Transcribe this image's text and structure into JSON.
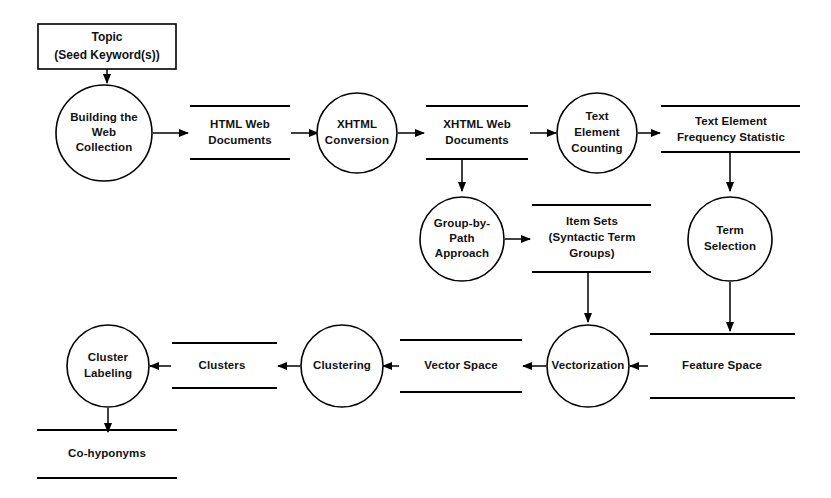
{
  "diagram": {
    "stroke_color": "#000000",
    "background_color": "#ffffff",
    "text_color": "#111111"
  },
  "external_entities": [
    {
      "id": "topic",
      "line1": "Topic",
      "line2": "(Seed Keyword(s))"
    }
  ],
  "processes": [
    {
      "id": "building-the-web-collection",
      "lines": [
        "Building the",
        "Web",
        "Collection"
      ]
    },
    {
      "id": "xhtml-conversion",
      "lines": [
        "XHTML",
        "Conversion"
      ]
    },
    {
      "id": "text-element-counting",
      "lines": [
        "Text",
        "Element",
        "Counting"
      ]
    },
    {
      "id": "group-by-path-approach",
      "lines": [
        "Group-by-",
        "Path",
        "Approach"
      ]
    },
    {
      "id": "term-selection",
      "lines": [
        "Term",
        "Selection"
      ]
    },
    {
      "id": "vectorization",
      "lines": [
        "Vectorization"
      ]
    },
    {
      "id": "clustering",
      "lines": [
        "Clustering"
      ]
    },
    {
      "id": "cluster-labeling",
      "lines": [
        "Cluster",
        "Labeling"
      ]
    }
  ],
  "data_stores": [
    {
      "id": "html-web-documents",
      "lines": [
        "HTML Web",
        "Documents"
      ]
    },
    {
      "id": "xhtml-web-documents",
      "lines": [
        "XHTML Web",
        "Documents"
      ]
    },
    {
      "id": "text-element-frequency-statistic",
      "lines": [
        "Text Element",
        "Frequency Statistic"
      ]
    },
    {
      "id": "item-sets",
      "lines": [
        "Item Sets",
        "(Syntactic Term",
        "Groups)"
      ]
    },
    {
      "id": "feature-space",
      "lines": [
        "Feature Space"
      ]
    },
    {
      "id": "vector-space",
      "lines": [
        "Vector Space"
      ]
    },
    {
      "id": "clusters",
      "lines": [
        "Clusters"
      ]
    },
    {
      "id": "co-hyponyms",
      "lines": [
        "Co-hyponyms"
      ]
    }
  ],
  "flows": [
    {
      "id": "topic-to-building",
      "from": "topic",
      "to": "building-the-web-collection"
    },
    {
      "id": "building-to-html-store",
      "from": "building-the-web-collection",
      "to": "html-web-documents"
    },
    {
      "id": "html-store-to-xhtml-conversion",
      "from": "html-web-documents",
      "to": "xhtml-conversion"
    },
    {
      "id": "xhtml-conversion-to-xhtml-store",
      "from": "xhtml-conversion",
      "to": "xhtml-web-documents"
    },
    {
      "id": "xhtml-store-to-text-element-counting",
      "from": "xhtml-web-documents",
      "to": "text-element-counting"
    },
    {
      "id": "xhtml-store-to-group-by-path",
      "from": "xhtml-web-documents",
      "to": "group-by-path-approach"
    },
    {
      "id": "counting-to-frequency-store",
      "from": "text-element-counting",
      "to": "text-element-frequency-statistic"
    },
    {
      "id": "frequency-store-to-term-selection",
      "from": "text-element-frequency-statistic",
      "to": "term-selection"
    },
    {
      "id": "group-by-path-to-item-sets",
      "from": "group-by-path-approach",
      "to": "item-sets"
    },
    {
      "id": "term-selection-to-feature-space",
      "from": "term-selection",
      "to": "feature-space"
    },
    {
      "id": "item-sets-to-vectorization",
      "from": "item-sets",
      "to": "vectorization"
    },
    {
      "id": "feature-space-to-vectorization",
      "from": "feature-space",
      "to": "vectorization"
    },
    {
      "id": "vectorization-to-vector-space",
      "from": "vectorization",
      "to": "vector-space"
    },
    {
      "id": "vector-space-to-clustering",
      "from": "vector-space",
      "to": "clustering"
    },
    {
      "id": "clustering-to-clusters",
      "from": "clustering",
      "to": "clusters"
    },
    {
      "id": "clusters-to-cluster-labeling",
      "from": "clusters",
      "to": "cluster-labeling"
    },
    {
      "id": "cluster-labeling-to-co-hyponyms",
      "from": "cluster-labeling",
      "to": "co-hyponyms"
    }
  ]
}
